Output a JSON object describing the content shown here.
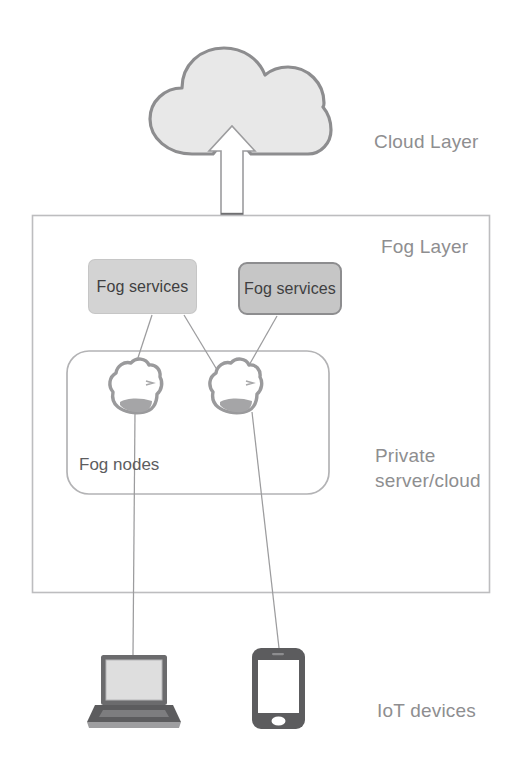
{
  "diagram": {
    "labels": {
      "cloud_layer": "Cloud Layer",
      "fog_layer": "Fog Layer",
      "private_server_cloud": "Private\nserver/cloud",
      "iot_devices": "IoT devices",
      "fog_nodes": "Fog nodes"
    },
    "services": [
      {
        "id": "fog-services-left",
        "label": "Fog services"
      },
      {
        "id": "fog-services-right",
        "label": "Fog services"
      }
    ],
    "icons": {
      "cloud": "cloud-icon",
      "arrow_up": "arrow-up-icon",
      "fog_node_left": "cloud-node-icon",
      "fog_node_right": "cloud-node-icon",
      "laptop": "laptop-icon",
      "smartphone": "smartphone-icon"
    },
    "colors": {
      "cloud_fill": "#e8e8e8",
      "cloud_stroke": "#8d8d8f",
      "box_stroke": "#b9b9bb",
      "service_left_fill": "#d3d3d3",
      "service_right_fill": "#c6c6c6",
      "service_right_stroke": "#8d8d8f",
      "node_stroke": "#9a9a9c",
      "device_dark": "#5c5c5e",
      "device_screen": "#dcdcdc",
      "connector": "#9c9c9e",
      "layer_label_text": "#8e8e90",
      "node_label_text": "#5d5d5f",
      "service_text": "#3f3f41",
      "background": "#ffffff"
    },
    "connections": [
      {
        "from": "fog-services-left",
        "to": "fog-node-left"
      },
      {
        "from": "fog-services-left",
        "to": "fog-node-right"
      },
      {
        "from": "fog-services-right",
        "to": "fog-node-right"
      },
      {
        "from": "fog-node-left",
        "to": "laptop-icon"
      },
      {
        "from": "fog-node-right",
        "to": "smartphone-icon"
      },
      {
        "from": "fog-layer",
        "to": "cloud-icon",
        "style": "arrow-up"
      }
    ]
  }
}
